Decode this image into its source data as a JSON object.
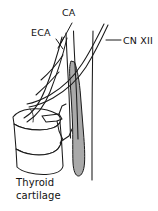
{
  "figure": {
    "type": "anatomical-line-drawing",
    "background_color": "#ffffff",
    "ink_color": "#1a1a1a",
    "shaded_color": "#a9a9a9",
    "labels": {
      "ca": "CA",
      "eca": "ECA",
      "cn12": "CN XII",
      "thyroid_line1": "Thyroid",
      "thyroid_line2": "cartilage"
    },
    "structures": [
      {
        "name": "carotid-artery",
        "abbr": "CA",
        "style": "outline"
      },
      {
        "name": "external-carotid-artery",
        "abbr": "ECA",
        "style": "outline"
      },
      {
        "name": "hypoglossal-nerve",
        "abbr": "CN XII",
        "style": "outline"
      },
      {
        "name": "internal-jugular-vein",
        "abbr": "",
        "style": "gray-shaded"
      },
      {
        "name": "thyroid-cartilage",
        "abbr": "",
        "style": "outline"
      }
    ]
  }
}
